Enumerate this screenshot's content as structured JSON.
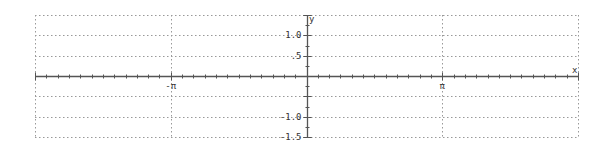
{
  "chart_data": {
    "type": "line",
    "title": "",
    "xlabel": "x",
    "ylabel": "y",
    "xlim": [
      -6.2832,
      6.2832
    ],
    "ylim": [
      -1.5,
      1.5
    ],
    "grid": true,
    "grid_style": "dotted",
    "x_ticks": [
      {
        "value": -3.14159,
        "label": "-π"
      },
      {
        "value": 3.14159,
        "label": "π"
      }
    ],
    "x_minor_tick_step": 0.2618,
    "y_ticks": [
      {
        "value": 1.5,
        "label": ""
      },
      {
        "value": 1.0,
        "label": "1.0"
      },
      {
        "value": 0.5,
        "label": ".5"
      },
      {
        "value": -0.5,
        "label": ""
      },
      {
        "value": -1.0,
        "label": "-1.0"
      },
      {
        "value": -1.5,
        "label": "-1.5"
      }
    ],
    "y_minor_tick_step": 0.25,
    "series": []
  },
  "colors": {
    "axis": "#555555",
    "grid": "#999999",
    "text": "#333333"
  }
}
